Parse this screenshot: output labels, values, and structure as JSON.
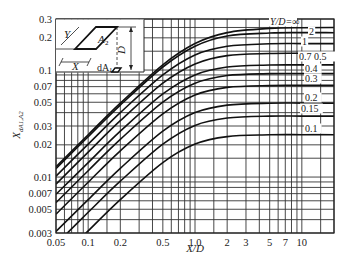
{
  "chart_data": {
    "type": "line",
    "title": "",
    "xlabel": "X/D",
    "ylabel": "X_{dA1,A2}",
    "xscale": "log",
    "yscale": "log",
    "xlim": [
      0.05,
      20
    ],
    "ylim": [
      0.003,
      0.3
    ],
    "grid": true,
    "x_ticks": [
      {
        "v": 0.05,
        "label": "0.05"
      },
      {
        "v": 0.1,
        "label": "0.1"
      },
      {
        "v": 0.2,
        "label": "0.2"
      },
      {
        "v": 0.5,
        "label": "0.5"
      },
      {
        "v": 1.0,
        "label": "1.0"
      },
      {
        "v": 2,
        "label": "2"
      },
      {
        "v": 3,
        "label": "3"
      },
      {
        "v": 5,
        "label": "5"
      },
      {
        "v": 7,
        "label": "7"
      },
      {
        "v": 10,
        "label": "10"
      }
    ],
    "y_ticks": [
      {
        "v": 0.3,
        "label": "0.3"
      },
      {
        "v": 0.2,
        "label": "0.2"
      },
      {
        "v": 0.1,
        "label": "0.1"
      },
      {
        "v": 0.07,
        "label": "0.07"
      },
      {
        "v": 0.05,
        "label": "0.05"
      },
      {
        "v": 0.03,
        "label": "0.03"
      },
      {
        "v": 0.02,
        "label": "0.02"
      },
      {
        "v": 0.01,
        "label": "0.01"
      },
      {
        "v": 0.007,
        "label": "0.007"
      },
      {
        "v": 0.005,
        "label": "0.005"
      },
      {
        "v": 0.003,
        "label": "0.003"
      }
    ],
    "x_grid": [
      0.05,
      0.06,
      0.07,
      0.08,
      0.09,
      0.1,
      0.15,
      0.2,
      0.3,
      0.4,
      0.5,
      0.6,
      0.7,
      0.8,
      0.9,
      1.0,
      1.5,
      2,
      3,
      4,
      5,
      6,
      7,
      8,
      9,
      10,
      15,
      20
    ],
    "y_grid": [
      0.003,
      0.004,
      0.005,
      0.006,
      0.007,
      0.008,
      0.009,
      0.01,
      0.015,
      0.02,
      0.03,
      0.04,
      0.05,
      0.06,
      0.07,
      0.08,
      0.09,
      0.1,
      0.15,
      0.2,
      0.25,
      0.3
    ],
    "x": [
      0.05,
      0.1,
      0.2,
      0.5,
      1,
      2,
      5,
      10,
      20
    ],
    "series": [
      {
        "name": "Y/D=∞",
        "label": "Y/D=∞",
        "values": [
          0.0125,
          0.0249,
          0.049,
          0.112,
          0.177,
          0.224,
          0.245,
          0.249,
          0.25
        ]
      },
      {
        "name": "2",
        "label": "2",
        "values": [
          0.012,
          0.0239,
          0.047,
          0.1067,
          0.167,
          0.208,
          0.222,
          0.224,
          0.2235
        ]
      },
      {
        "name": "1",
        "label": "1",
        "values": [
          0.0102,
          0.0203,
          0.04,
          0.09,
          0.1385,
          0.167,
          0.176,
          0.1767,
          0.1768
        ]
      },
      {
        "name": "0.7",
        "label": "0.7",
        "values": [
          0.0086,
          0.0171,
          0.0336,
          0.0753,
          0.114,
          0.1366,
          0.1428,
          0.1434,
          0.1434
        ]
      },
      {
        "name": "0.5",
        "label": "0.5",
        "values": [
          0.0069,
          0.01366,
          0.0268,
          0.0598,
          0.09,
          0.1068,
          0.1114,
          0.1117,
          0.1117
        ]
      },
      {
        "name": "0.4",
        "label": "0.4",
        "values": [
          0.00577,
          0.01147,
          0.0225,
          0.0501,
          0.0752,
          0.0889,
          0.0926,
          0.0928,
          0.0928
        ]
      },
      {
        "name": "0.3",
        "label": "0.3",
        "values": [
          0.0045,
          0.00896,
          0.0176,
          0.039,
          0.0585,
          0.0688,
          0.0716,
          0.0718,
          0.0718
        ]
      },
      {
        "name": "0.2",
        "label": "0.2",
        "values": [
          0.0031,
          0.00615,
          0.01205,
          0.0268,
          0.04,
          0.047,
          0.049,
          0.0491,
          0.049
        ]
      },
      {
        "name": "0.15",
        "label": "0.15",
        "values": [
          0.00235,
          0.00468,
          0.00915,
          0.0203,
          0.0304,
          0.0356,
          0.0371,
          0.0371,
          0.0371
        ]
      },
      {
        "name": "0.1",
        "label": "0.1",
        "values": [
          0.00158,
          0.00314,
          0.00616,
          0.01366,
          0.0203,
          0.0239,
          0.0248,
          0.0249,
          0.0249
        ]
      }
    ],
    "curve_labels": [
      {
        "text": "Y/D=∞",
        "x": 270,
        "y": 25
      },
      {
        "text": "2",
        "x": 309,
        "y": 35
      },
      {
        "text": "1",
        "x": 302,
        "y": 45
      },
      {
        "text": "0.7 0.5",
        "x": 299,
        "y": 60
      },
      {
        "text": "0.4",
        "x": 305,
        "y": 72
      },
      {
        "text": "0.3",
        "x": 305,
        "y": 82
      },
      {
        "text": "0.2",
        "x": 305,
        "y": 101
      },
      {
        "text": "0.15",
        "x": 301,
        "y": 112
      },
      {
        "text": "0.1",
        "x": 305,
        "y": 132
      }
    ],
    "legend_position": "right, inline curve labels",
    "inset_diagram": {
      "labels": {
        "Y": "Y",
        "A2": "A",
        "A2_sub": "2",
        "D": "D",
        "X": "X",
        "dA1": "dA",
        "dA1_sub": "1"
      }
    }
  }
}
